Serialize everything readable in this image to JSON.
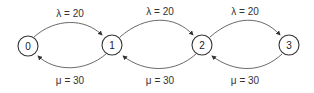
{
  "states": [
    {
      "id": "0",
      "label": "0"
    },
    {
      "id": "1",
      "label": "1"
    },
    {
      "id": "2",
      "label": "2"
    },
    {
      "id": "3",
      "label": "3"
    }
  ],
  "arrival_labels": [
    "λ = 20",
    "λ = 20",
    "λ = 20"
  ],
  "service_labels": [
    "μ = 30",
    "μ = 30",
    "μ = 30"
  ],
  "colors": {
    "stroke": "#333333",
    "text": "#333333",
    "background": "#ffffff"
  }
}
